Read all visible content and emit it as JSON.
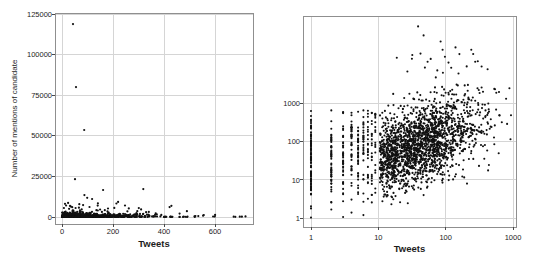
{
  "figure": {
    "width": 536,
    "height": 262,
    "background": "#ffffff"
  },
  "style": {
    "point_color": "#111111",
    "grid_color": "#d5d5d5",
    "frame_color": "#8f8f8f",
    "tick_color": "#4a4a4a",
    "text_color": "#1d1d1d",
    "tick_font_px": 7.5,
    "axis_label_font_px": 9.5,
    "ylabel_font_px": 8
  },
  "chart_data": [
    {
      "id": "linear-scatter",
      "type": "scatter",
      "xscale": "linear",
      "yscale": "linear",
      "title": "",
      "xlabel": "Tweets",
      "ylabel": "Number of mentions of candidate",
      "xlim": [
        -28,
        752
      ],
      "ylim": [
        -4300,
        125600
      ],
      "grid": true,
      "legend": "none",
      "xticks": [
        {
          "v": 0,
          "label": "0"
        },
        {
          "v": 200,
          "label": "200"
        },
        {
          "v": 400,
          "label": "400"
        },
        {
          "v": 600,
          "label": "600"
        }
      ],
      "yticks": [
        {
          "v": 0,
          "label": "0"
        },
        {
          "v": 25000,
          "label": "25000"
        },
        {
          "v": 50000,
          "label": "50000"
        },
        {
          "v": 75000,
          "label": "75000"
        },
        {
          "v": 100000,
          "label": "100000"
        },
        {
          "v": 125000,
          "label": "125000"
        }
      ],
      "notable_points": [
        [
          43,
          118800
        ],
        [
          55,
          80000
        ],
        [
          87,
          53600
        ],
        [
          51,
          23300
        ],
        [
          161,
          16600
        ],
        [
          319,
          17200
        ],
        [
          88,
          13500
        ],
        [
          99,
          11800
        ],
        [
          118,
          11100
        ],
        [
          220,
          9300
        ],
        [
          24,
          8700
        ],
        [
          68,
          7900
        ],
        [
          140,
          7000
        ],
        [
          35,
          6400
        ],
        [
          205,
          5600
        ],
        [
          262,
          5300
        ],
        [
          310,
          4700
        ],
        [
          422,
          6100
        ],
        [
          429,
          6900
        ],
        [
          490,
          3600
        ]
      ],
      "generator": {
        "kind": "linear_band",
        "seed": 11,
        "band_n": 880,
        "x_mean": 112,
        "x_max": 745,
        "y_mean": 600,
        "boost_p": 0.07,
        "boost_base": 1500,
        "boost_mean": 2000,
        "damp_x": 390,
        "damp_f": 0.3,
        "y_cap": 12500,
        "tail_n": 12,
        "tail_x0": 450,
        "tail_y_mean": 700
      },
      "point_r": 1.1,
      "layout": {
        "frame": {
          "l": 55,
          "t": 13,
          "r": 253,
          "b": 224
        },
        "x": {
          "type": "linear",
          "v1": 0,
          "p1": 62,
          "v2": 600,
          "p2": 215
        },
        "y": {
          "type": "linear",
          "v1": 0,
          "p1": 217,
          "v2": 125000,
          "p2": 14
        },
        "xtick_label_y": 234,
        "xlabel_y": 247,
        "ytick_label_x": 52,
        "ylabel_x": 17
      }
    },
    {
      "id": "loglog-scatter",
      "type": "scatter",
      "xscale": "log",
      "yscale": "log",
      "title": "",
      "xlabel": "Tweets",
      "ylabel": "",
      "xlim": [
        0.76,
        1100
      ],
      "ylim": [
        0.56,
        200000
      ],
      "grid": true,
      "legend": "none",
      "xticks": [
        {
          "v": 1,
          "label": "1"
        },
        {
          "v": 10,
          "label": "10"
        },
        {
          "v": 100,
          "label": "100"
        },
        {
          "v": 1000,
          "label": "1000"
        }
      ],
      "yticks": [
        {
          "v": 1,
          "label": "1"
        },
        {
          "v": 10,
          "label": "10"
        },
        {
          "v": 100,
          "label": "100"
        },
        {
          "v": 1000,
          "label": "1000"
        }
      ],
      "notable_points": [
        [
          39,
          107000
        ],
        [
          47,
          62000
        ],
        [
          84,
          43000
        ],
        [
          140,
          30000
        ],
        [
          240,
          26000
        ],
        [
          32,
          19000
        ],
        [
          60,
          15000
        ],
        [
          110,
          12000
        ],
        [
          90,
          26000
        ],
        [
          160,
          20000
        ],
        [
          300,
          13000
        ],
        [
          205,
          9500
        ],
        [
          27,
          7000
        ],
        [
          420,
          8000
        ]
      ],
      "generator": {
        "kind": "loglog_cloud",
        "seed": 23,
        "columns": [
          85,
          52,
          44,
          40,
          38,
          30,
          26,
          22,
          18
        ],
        "col_a": 1.42,
        "col_b": 0.38,
        "col_sd": 0.62,
        "col_lo": 0,
        "col_hi": 2.85,
        "cloud_n": 1900,
        "cx": 1.62,
        "cx_sd": 0.43,
        "cx_lo": 1.02,
        "cx_hi": 2.97,
        "a": 0.93,
        "b": 0.62,
        "sd": 0.5,
        "lo": 0.3,
        "hi": 3.55,
        "high_p": 0.012,
        "high_max": 4.35
      },
      "point_r": 1.05,
      "layout": {
        "frame": {
          "l": 303,
          "t": 16,
          "r": 516,
          "b": 227
        },
        "x": {
          "type": "log",
          "v1": 1,
          "p1": 311,
          "v2": 1000,
          "p2": 513
        },
        "y": {
          "type": "log",
          "v1": 1,
          "p1": 218,
          "v2": 1000,
          "p2": 103.7
        },
        "xtick_label_y": 240,
        "xlabel_y": 252,
        "ytick_label_x": 300,
        "ylabel_x": 283
      }
    }
  ]
}
